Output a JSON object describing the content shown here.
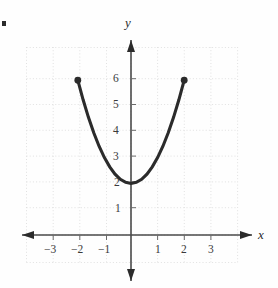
{
  "figure": {
    "bullet": "▪",
    "background_color": "#fefefe",
    "axis_color": "#4a4a4a",
    "grid_color": "#dcdcdc",
    "curve_color": "#2b2b2b",
    "label_color": "#3a3a3a"
  },
  "axes": {
    "x_label": "x",
    "y_label": "y",
    "x_ticks": [
      {
        "value": -3,
        "label": "−3"
      },
      {
        "value": -2,
        "label": "−2"
      },
      {
        "value": -1,
        "label": "−1"
      },
      {
        "value": 1,
        "label": "1"
      },
      {
        "value": 2,
        "label": "2"
      },
      {
        "value": 3,
        "label": "3"
      }
    ],
    "y_ticks": [
      {
        "value": 1,
        "label": "1"
      },
      {
        "value": 2,
        "label": "2"
      },
      {
        "value": 3,
        "label": "3"
      },
      {
        "value": 4,
        "label": "4"
      },
      {
        "value": 5,
        "label": "5"
      },
      {
        "value": 6,
        "label": "6"
      }
    ]
  },
  "chart_data": {
    "type": "line",
    "title": "",
    "xlabel": "x",
    "ylabel": "y",
    "xlim": [
      -4.1,
      4.2
    ],
    "ylim": [
      -1.1,
      7.3
    ],
    "grid": true,
    "grid_style": "dotted",
    "legend": "none",
    "equation": "y = x^2 + 2",
    "domain": [
      -2,
      2
    ],
    "range": [
      2,
      6
    ],
    "vertex": [
      0,
      2
    ],
    "endpoints": [
      {
        "x": -2,
        "y": 6,
        "marker": "filled-circle"
      },
      {
        "x": 2,
        "y": 6,
        "marker": "filled-circle"
      }
    ],
    "series": [
      {
        "name": "y = x^2 + 2",
        "points": [
          [
            -2,
            6
          ],
          [
            -1.8,
            5.24
          ],
          [
            -1.6,
            4.56
          ],
          [
            -1.4,
            3.96
          ],
          [
            -1.2,
            3.44
          ],
          [
            -1,
            3
          ],
          [
            -0.8,
            2.64
          ],
          [
            -0.6,
            2.36
          ],
          [
            -0.4,
            2.16
          ],
          [
            -0.2,
            2.04
          ],
          [
            0,
            2
          ],
          [
            0.2,
            2.04
          ],
          [
            0.4,
            2.16
          ],
          [
            0.6,
            2.36
          ],
          [
            0.8,
            2.64
          ],
          [
            1,
            3
          ],
          [
            1.2,
            3.44
          ],
          [
            1.4,
            3.96
          ],
          [
            1.6,
            4.56
          ],
          [
            1.8,
            5.24
          ],
          [
            2,
            6
          ]
        ]
      }
    ]
  }
}
